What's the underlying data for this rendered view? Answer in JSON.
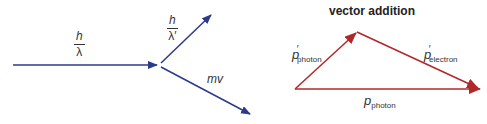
{
  "left_diagram": {
    "incident_label": {
      "numerator": "h",
      "denominator": "λ"
    },
    "scattered_label": {
      "numerator": "h",
      "denominator": "λ′"
    },
    "electron_label": "mv",
    "color": "#2b3a8a"
  },
  "right_diagram": {
    "title": "vector addition",
    "p_photon_prime": {
      "symbol": "p",
      "prime": "′",
      "subscript": "photon"
    },
    "p_electron_prime": {
      "symbol": "p",
      "prime": "′",
      "subscript": "electron"
    },
    "p_photon": {
      "symbol": "p",
      "subscript": "photon"
    },
    "color": "#b0282a"
  }
}
